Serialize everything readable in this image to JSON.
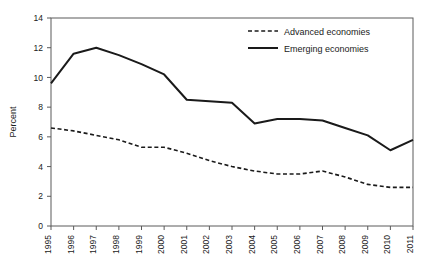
{
  "chart_data": {
    "type": "line",
    "title": "",
    "xlabel": "",
    "ylabel": "Percent",
    "ylim": [
      0,
      14
    ],
    "ytick_step": 2,
    "yticks": [
      "0",
      "2",
      "4",
      "6",
      "8",
      "10",
      "12",
      "14"
    ],
    "grid": false,
    "legend_position": "top-right",
    "categories": [
      "1995",
      "1996",
      "1997",
      "1998",
      "1999",
      "2000",
      "2001",
      "2002",
      "2003",
      "2004",
      "2005",
      "2006",
      "2007",
      "2008",
      "2009",
      "2010",
      "2011"
    ],
    "series": [
      {
        "name": "Advanced economies",
        "style": "dashed",
        "color": "#1a1a1a",
        "values": [
          6.6,
          6.4,
          6.1,
          5.8,
          5.3,
          5.3,
          4.9,
          4.4,
          4.0,
          3.7,
          3.5,
          3.5,
          3.7,
          3.3,
          2.8,
          2.6,
          2.6
        ]
      },
      {
        "name": "Emerging economies",
        "style": "solid",
        "color": "#1a1a1a",
        "values": [
          9.6,
          11.6,
          12.0,
          11.5,
          10.9,
          10.2,
          8.5,
          8.4,
          8.3,
          6.9,
          7.2,
          7.2,
          7.1,
          6.6,
          6.1,
          5.1,
          5.8
        ]
      }
    ]
  },
  "legend": {
    "items": [
      {
        "label": "Advanced economies",
        "style": "dashed"
      },
      {
        "label": "Emerging economies",
        "style": "solid"
      }
    ]
  },
  "axis": {
    "y_title": "Percent"
  }
}
